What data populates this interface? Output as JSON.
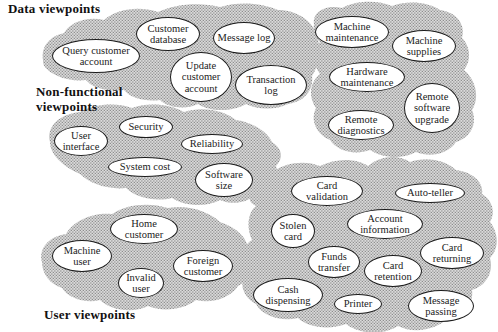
{
  "labels": {
    "data": "Data viewpoints",
    "non_functional": "Non-functional\nviewpoints",
    "user": "User viewpoints"
  },
  "groups": {
    "data": {
      "nodes": [
        "Query customer account",
        "Customer database",
        "Message log",
        "Update customer account",
        "Transaction log"
      ]
    },
    "machine": {
      "nodes": [
        "Machine maintenance",
        "Machine supplies",
        "Hardware maintenance",
        "Remote software upgrade",
        "Remote diagnostics"
      ]
    },
    "non_functional": {
      "nodes": [
        "User interface",
        "Security",
        "Reliability",
        "System cost",
        "Software size"
      ]
    },
    "user": {
      "nodes": [
        "Home customer",
        "Machine user",
        "Invalid user",
        "Foreign customer"
      ]
    },
    "atm": {
      "nodes": [
        "Card validation",
        "Auto-teller",
        "Stolen card",
        "Account information",
        "Card returning",
        "Funds transfer",
        "Card retention",
        "Cash dispensing",
        "Printer",
        "Message passing"
      ]
    }
  },
  "colors": {
    "blob_base": "#dadada",
    "blob_dot": "#8e8e8e",
    "ellipse_fill": "#ffffff",
    "ellipse_border": "#1b1b1b",
    "text": "#222222",
    "label_text": "#111111"
  }
}
